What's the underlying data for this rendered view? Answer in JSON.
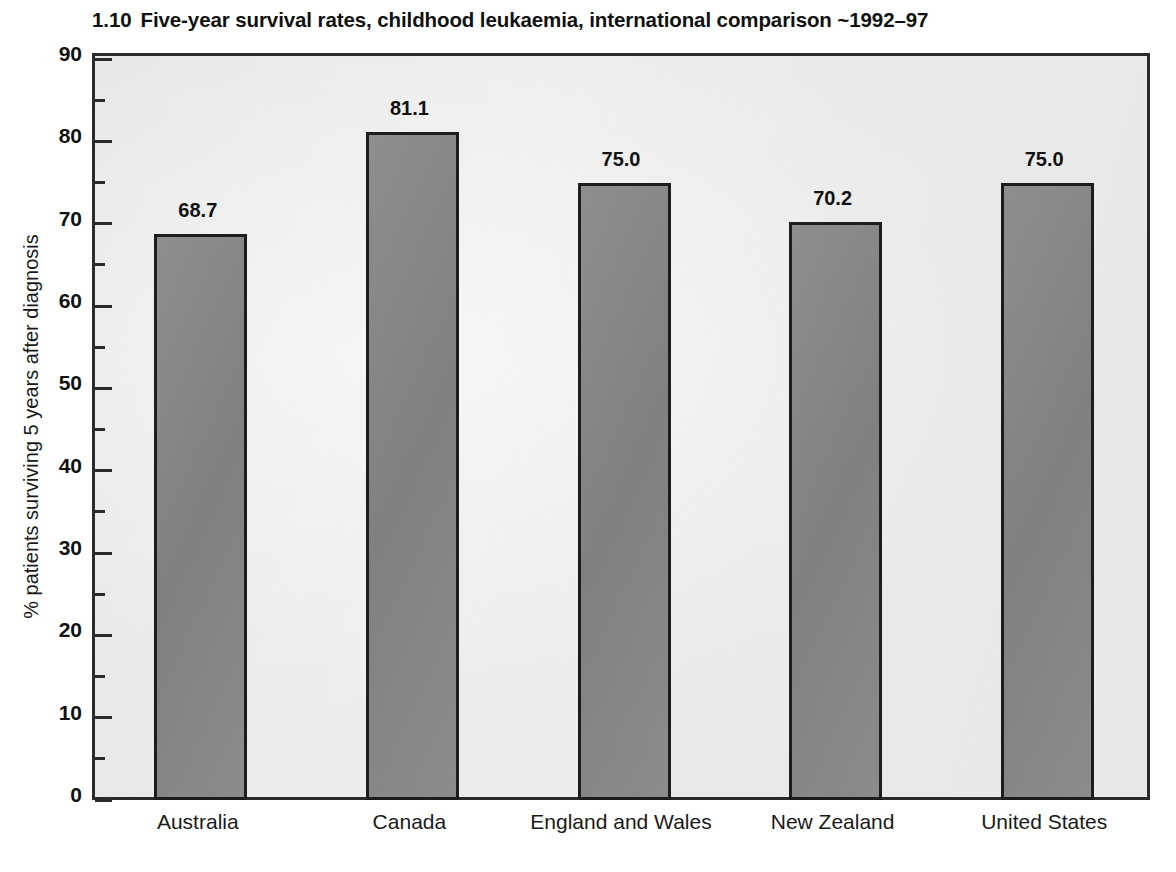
{
  "chart_data": {
    "type": "bar",
    "title_number": "1.10",
    "title_text": "Five-year survival rates, childhood leukaemia, international comparison ~1992–97",
    "categories": [
      "Australia",
      "Canada",
      "England and Wales",
      "New Zealand",
      "United States"
    ],
    "values": [
      68.7,
      81.1,
      75.0,
      70.2,
      75.0
    ],
    "value_labels": [
      "68.7",
      "81.1",
      "75.0",
      "70.2",
      "75.0"
    ],
    "xlabel": "",
    "ylabel": "% patients surviving 5 years after diagnosis",
    "ylim": [
      0,
      90
    ],
    "ytick_labels": [
      "0",
      "10",
      "20",
      "30",
      "40",
      "50",
      "60",
      "70",
      "80",
      "90"
    ],
    "ytick_values": [
      0,
      10,
      20,
      30,
      40,
      50,
      60,
      70,
      80,
      90
    ],
    "yminor_tick_values": [
      5,
      15,
      25,
      35,
      45,
      55,
      65,
      75,
      85
    ],
    "ytick_interval": 10,
    "yminor_tick_interval": 5,
    "grid": false,
    "legend": false,
    "legend_position": "none",
    "colors": {
      "bar_fill": "#878787",
      "bar_border": "#1d1d1d",
      "plot_background": "#ececec",
      "frame": "#2b2b2b",
      "page_background": "#ffffff",
      "text": "#111111"
    }
  }
}
